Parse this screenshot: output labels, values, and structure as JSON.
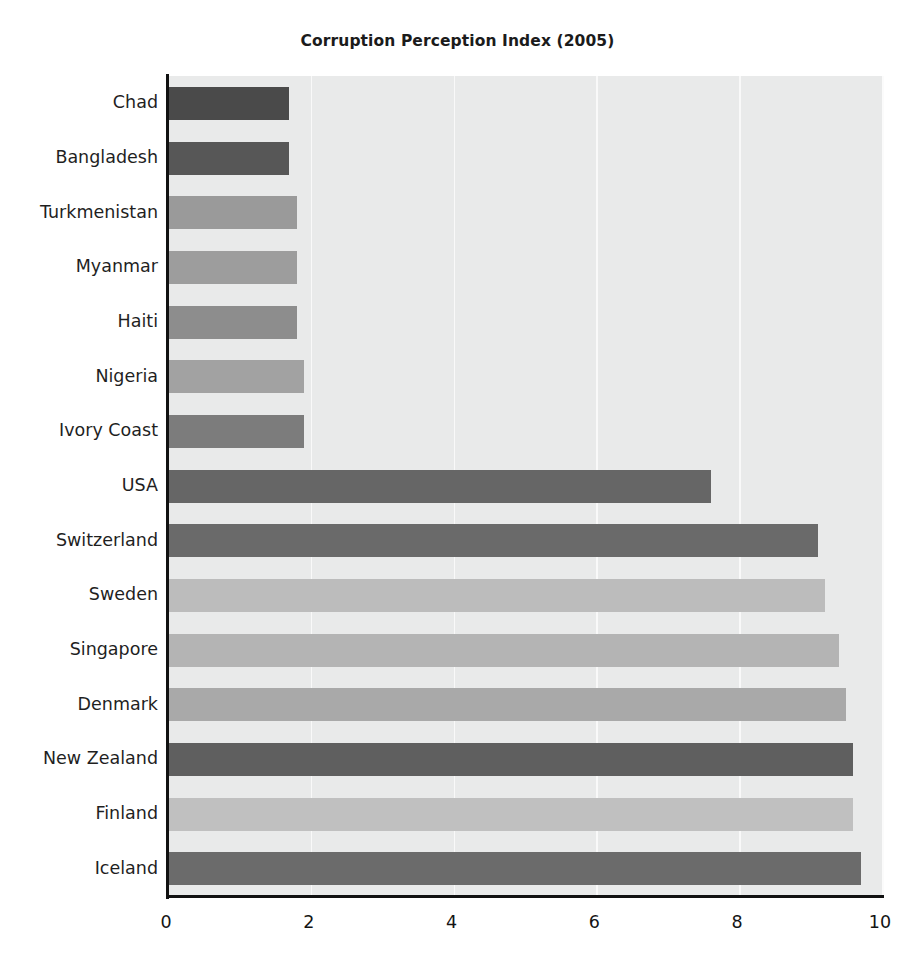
{
  "chart_data": {
    "type": "bar",
    "orientation": "horizontal",
    "title": "Corruption Perception Index (2005)",
    "xlabel": "",
    "ylabel": "",
    "xlim": [
      0,
      10
    ],
    "xticks": [
      0,
      2,
      4,
      6,
      8,
      10
    ],
    "xtick_labels": [
      "0",
      "2",
      "4",
      "6",
      "8",
      "10"
    ],
    "grid": true,
    "grid_axis": "x",
    "grid_color": "#fbfbfb",
    "legend": false,
    "plot_background": "#e9eaea",
    "figure_background": "#ffffff",
    "categories": [
      "Chad",
      "Bangladesh",
      "Turkmenistan",
      "Myanmar",
      "Haiti",
      "Nigeria",
      "Ivory Coast",
      "USA",
      "Switzerland",
      "Sweden",
      "Singapore",
      "Denmark",
      "New Zealand",
      "Finland",
      "Iceland"
    ],
    "values": [
      1.7,
      1.7,
      1.8,
      1.8,
      1.8,
      1.9,
      1.9,
      7.6,
      9.1,
      9.2,
      9.4,
      9.5,
      9.6,
      9.6,
      9.7
    ],
    "bar_colors": [
      "#4a4a4a",
      "#575757",
      "#9a9a9a",
      "#9d9d9d",
      "#8d8d8d",
      "#a2a2a2",
      "#7c7c7c",
      "#666666",
      "#6a6a6a",
      "#bcbcbc",
      "#b4b4b4",
      "#a9a9a9",
      "#5f5f5f",
      "#c0c0c0",
      "#6b6b6b"
    ]
  }
}
